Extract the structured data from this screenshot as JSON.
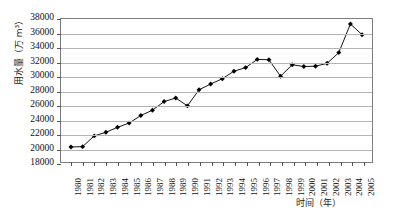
{
  "chart_data": {
    "type": "line",
    "title": "",
    "xlabel": "时间（年）",
    "ylabel": "用水量（万 m³）",
    "ylim": [
      18000,
      38000
    ],
    "ytick_step": 2000,
    "ytick_labels": [
      "38000",
      "36000",
      "34000",
      "32000",
      "30000",
      "28000",
      "26000",
      "24000",
      "22000",
      "20000",
      "18000"
    ],
    "ytick_values": [
      38000,
      36000,
      34000,
      32000,
      30000,
      28000,
      26000,
      24000,
      22000,
      20000,
      18000
    ],
    "grid": true,
    "legend": "none",
    "marker": "diamond",
    "line_color": "#111111",
    "marker_color": "#000000",
    "categories": [
      "1980",
      "1981",
      "1982",
      "1983",
      "1984",
      "1985",
      "1986",
      "1987",
      "1988",
      "1989",
      "1990",
      "1991",
      "1992",
      "1993",
      "1994",
      "1995",
      "1996",
      "1997",
      "1998",
      "1999",
      "2000",
      "2001",
      "2002",
      "2003",
      "2004",
      "2005"
    ],
    "x": [
      1980,
      1981,
      1982,
      1983,
      1984,
      1985,
      1986,
      1987,
      1988,
      1989,
      1990,
      1991,
      1992,
      1993,
      1994,
      1995,
      1996,
      1997,
      1998,
      1999,
      2000,
      2001,
      2002,
      2003,
      2004,
      2005
    ],
    "values": [
      20100,
      20150,
      21650,
      22150,
      22850,
      23450,
      24500,
      25250,
      26450,
      26950,
      25850,
      28100,
      28900,
      29650,
      30700,
      31200,
      32350,
      32300,
      30000,
      31600,
      31350,
      31400,
      31800,
      33300,
      37300,
      35800
    ],
    "series": [
      {
        "name": "用水量",
        "values": [
          20100,
          20150,
          21650,
          22150,
          22850,
          23450,
          24500,
          25250,
          26450,
          26950,
          25850,
          28100,
          28900,
          29650,
          30700,
          31200,
          32350,
          32300,
          30000,
          31600,
          31350,
          31400,
          31800,
          33300,
          37300,
          35800
        ]
      }
    ]
  }
}
